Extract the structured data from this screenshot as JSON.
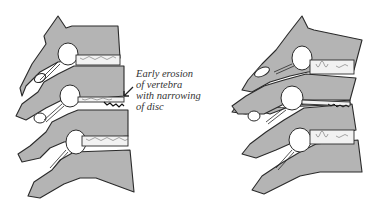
{
  "figure": {
    "type": "anatomical-diagram",
    "panels": [
      {
        "id": "a",
        "description": "three vertebrae with early erosion and narrowing of middle disc"
      },
      {
        "id": "b",
        "description": "three vertebrae with collapsed middle disc"
      }
    ],
    "annotation": {
      "lines": [
        "Early erosion",
        "of vertebra",
        "with narrowing",
        "of disc"
      ]
    },
    "colors": {
      "bone": "#b4b4b4",
      "outline": "#2a2a2a",
      "background": "#ffffff"
    }
  }
}
